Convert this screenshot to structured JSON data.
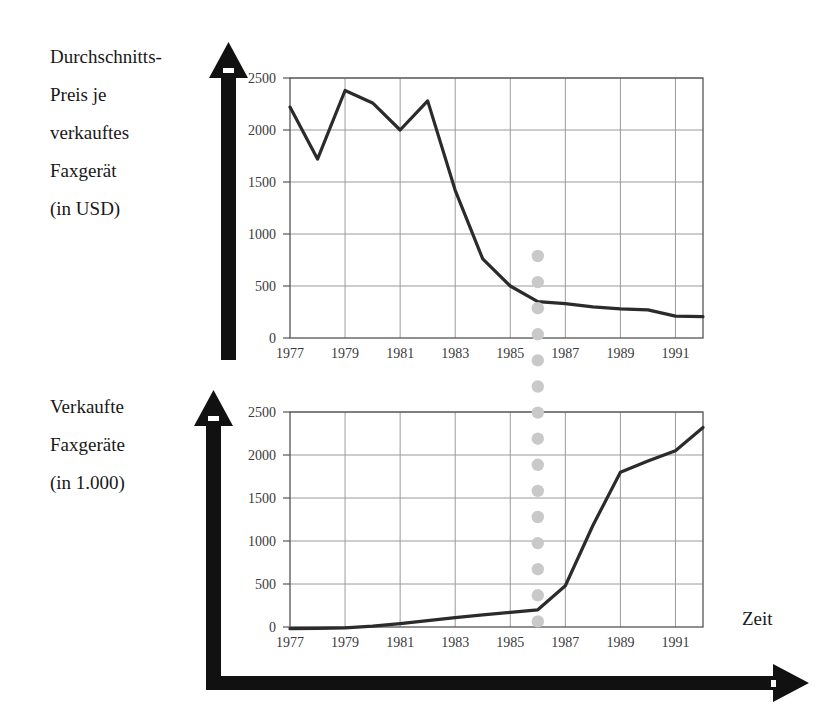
{
  "labels": {
    "price_axis": [
      "Durchschnitts-",
      "Preis je",
      "verkauftes",
      "Faxgerät",
      "(in USD)"
    ],
    "units_axis": [
      "Verkaufte",
      "Faxgeräte",
      "(in 1.000)"
    ],
    "time_axis": "Zeit"
  },
  "chart_data": [
    {
      "type": "line",
      "title": "Durchschnittspreis je verkauftes Faxgerät (in USD)",
      "ylabel": "Durchschnitts-Preis je verkauftes Faxgerät (in USD)",
      "xlabel": "Zeit",
      "grid": true,
      "legend": "none",
      "xlim": [
        1977,
        1992
      ],
      "ylim": [
        0,
        2500
      ],
      "ytick_labels": [
        "0",
        "500",
        "1000",
        "1500",
        "2000",
        "2500"
      ],
      "yticks": [
        0,
        500,
        1000,
        1500,
        2000,
        2500
      ],
      "xtick_labels": [
        "1977",
        "1979",
        "1981",
        "1983",
        "1985",
        "1987",
        "1989",
        "1991"
      ],
      "xticks": [
        1977,
        1979,
        1981,
        1983,
        1985,
        1987,
        1989,
        1991
      ],
      "x": [
        1977,
        1978,
        1979,
        1980,
        1981,
        1982,
        1983,
        1984,
        1985,
        1986,
        1987,
        1988,
        1989,
        1990,
        1991,
        1992
      ],
      "values": [
        2220,
        1720,
        2380,
        2260,
        2000,
        2280,
        1420,
        760,
        500,
        350,
        330,
        300,
        280,
        270,
        210,
        205
      ],
      "line_color": "#2b2b2b",
      "grid_color": "#9a9a9a"
    },
    {
      "type": "line",
      "title": "Verkaufte Faxgeräte (in 1.000)",
      "ylabel": "Verkaufte Faxgeräte (in 1.000)",
      "xlabel": "Zeit",
      "grid": true,
      "legend": "none",
      "xlim": [
        1977,
        1992
      ],
      "ylim": [
        0,
        2500
      ],
      "ytick_labels": [
        "0",
        "500",
        "1000",
        "1500",
        "2000",
        "2500"
      ],
      "yticks": [
        0,
        500,
        1000,
        1500,
        2000,
        2500
      ],
      "xtick_labels": [
        "1977",
        "1979",
        "1981",
        "1983",
        "1985",
        "1987",
        "1989",
        "1991"
      ],
      "xticks": [
        1977,
        1979,
        1981,
        1983,
        1985,
        1987,
        1989,
        1991
      ],
      "x": [
        1977,
        1978,
        1979,
        1980,
        1981,
        1982,
        1983,
        1984,
        1985,
        1986,
        1987,
        1988,
        1989,
        1990,
        1991,
        1992
      ],
      "values": [
        -20,
        -15,
        -10,
        10,
        40,
        75,
        110,
        140,
        170,
        200,
        480,
        1180,
        1800,
        1930,
        2050,
        2320
      ],
      "line_color": "#2b2b2b",
      "grid_color": "#9a9a9a"
    }
  ],
  "annotation": {
    "marker_name": "dotted-vertical-connector",
    "marker_year": 1986,
    "marker_color": "#c9c9c9",
    "description": "Gepunktete vertikale Verbindungslinie bei 1986"
  },
  "colors": {
    "axis_arrow": "#111111",
    "plot_border": "#555555",
    "gridline": "#9a9a9a",
    "series_line": "#2b2b2b",
    "dot_marker": "#c9c9c9",
    "text": "#181818"
  }
}
